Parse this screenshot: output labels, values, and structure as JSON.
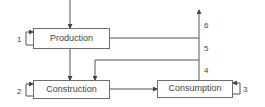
{
  "diagram": {
    "nodes": [
      {
        "id": "production",
        "label": "Production",
        "self_loop_label": "1"
      },
      {
        "id": "construction",
        "label": "Construction",
        "self_loop_label": "2"
      },
      {
        "id": "consumption",
        "label": "Consumption",
        "self_loop_label": "3"
      }
    ],
    "flow_labels": {
      "four": "4",
      "five": "5",
      "six": "6"
    },
    "edges": [
      {
        "from": "input",
        "to": "production"
      },
      {
        "from": "production",
        "to": "construction"
      },
      {
        "from": "production",
        "to": "trunk"
      },
      {
        "from": "trunk",
        "to": "construction"
      },
      {
        "from": "construction",
        "to": "consumption"
      },
      {
        "from": "consumption",
        "to": "output",
        "labels": [
          "4",
          "5",
          "6"
        ]
      }
    ],
    "colors": {
      "stroke": "#555555",
      "text": "#444444",
      "background": "#ffffff"
    }
  }
}
